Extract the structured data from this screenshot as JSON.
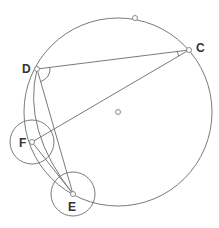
{
  "diagram": {
    "type": "geometry-construction",
    "colors": {
      "stroke": "#7a7a7a",
      "point_fill": "#ffffff",
      "point_stroke": "#8a8a8a",
      "label": "#333333"
    },
    "main_circle": {
      "cx": 118,
      "cy": 112,
      "r": 94
    },
    "small_circles": [
      {
        "name": "circle-F",
        "cx": 32,
        "cy": 142,
        "r": 22
      },
      {
        "name": "circle-E",
        "cx": 73,
        "cy": 194,
        "r": 22
      }
    ],
    "points": {
      "D": {
        "label": "D",
        "x": 37,
        "y": 69
      },
      "C": {
        "label": "C",
        "x": 189,
        "y": 50
      },
      "F": {
        "label": "F",
        "x": 32,
        "y": 142
      },
      "E": {
        "label": "E",
        "x": 73,
        "y": 194
      },
      "top": {
        "label": "",
        "x": 135,
        "y": 18
      },
      "center": {
        "label": "",
        "x": 118,
        "y": 112
      }
    },
    "segments": [
      [
        "D",
        "C"
      ],
      [
        "D",
        "E"
      ],
      [
        "C",
        "F"
      ],
      [
        "F",
        "E"
      ]
    ],
    "labels": {
      "D": "D",
      "C": "C",
      "F": "F",
      "E": "E"
    }
  }
}
